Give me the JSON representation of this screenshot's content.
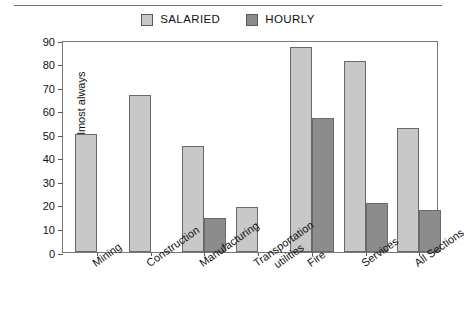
{
  "legend": {
    "position": "top-center",
    "items": [
      {
        "label": "SALARIED",
        "color": "#c8c8c8",
        "icon": "square-swatch-icon"
      },
      {
        "label": "HOURLY",
        "color": "#8c8c8c",
        "icon": "square-swatch-icon"
      }
    ]
  },
  "axes": {
    "y": {
      "title": "% Frequently/almost always",
      "ticks": [
        "0",
        "10",
        "20",
        "30",
        "40",
        "50",
        "60",
        "70",
        "80",
        "90"
      ],
      "min": 0,
      "max": 90,
      "step": 10
    },
    "x": {
      "categories": [
        {
          "line1": "Mining",
          "line2": ""
        },
        {
          "line1": "Construction",
          "line2": ""
        },
        {
          "line1": "Manufacturing",
          "line2": ""
        },
        {
          "line1": "Transportation",
          "line2": "utilities"
        },
        {
          "line1": "Fire",
          "line2": ""
        },
        {
          "line1": "Services",
          "line2": ""
        },
        {
          "line1": "All Sections",
          "line2": ""
        }
      ]
    }
  },
  "chart_data": {
    "type": "bar",
    "title": "",
    "xlabel": "",
    "ylabel": "% Frequently/almost always",
    "ylim": [
      0,
      90
    ],
    "ytick_step": 10,
    "grid": false,
    "legend_position": "top-center",
    "categories": [
      "Mining",
      "Construction",
      "Manufacturing",
      "Transportation utilities",
      "Fire",
      "Services",
      "All Sections"
    ],
    "series": [
      {
        "name": "SALARIED",
        "color": "#c8c8c8",
        "values": [
          50,
          66.5,
          45,
          19,
          87,
          81,
          52.5
        ]
      },
      {
        "name": "HOURLY",
        "color": "#8c8c8c",
        "values": [
          null,
          null,
          14.5,
          null,
          57,
          21,
          18
        ]
      }
    ]
  }
}
